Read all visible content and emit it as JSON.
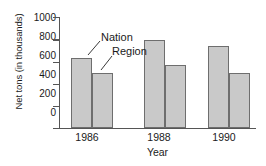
{
  "chart_data": {
    "type": "bar",
    "title": "",
    "xlabel": "Year",
    "ylabel": "Net tons (in thousands)",
    "categories": [
      "1986",
      "1988",
      "1990"
    ],
    "series": [
      {
        "name": "Nation",
        "values": [
          630,
          790,
          735
        ]
      },
      {
        "name": "Region",
        "values": [
          500,
          570,
          500
        ]
      }
    ],
    "ylim": [
      0,
      1000
    ],
    "yticks": [
      "0",
      "200",
      "400",
      "600",
      "800",
      "1000"
    ],
    "ytick_values": [
      0,
      200,
      400,
      600,
      800,
      1000
    ],
    "grid": false,
    "legend": "annotation-labels-on-first-group",
    "annotations": [
      {
        "label": "Nation",
        "points_to": "1986 Nation bar"
      },
      {
        "label": "Region",
        "points_to": "1986 Region bar"
      }
    ],
    "colors": {
      "bar_fill": "#c9c9c9",
      "bar_edge": "#6e6e6e",
      "axis": "#555555",
      "text": "#1a1a1a",
      "background": "#ffffff"
    }
  }
}
